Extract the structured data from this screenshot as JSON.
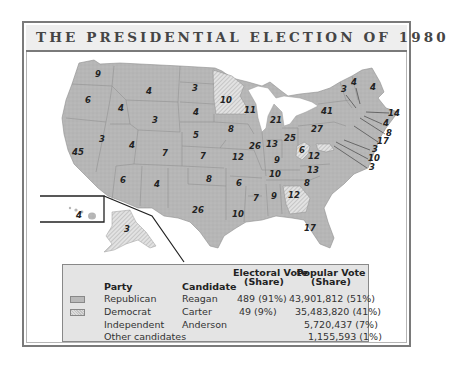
{
  "title": "THE PRESIDENTIAL ELECTION OF 1980",
  "colors": {
    "republican": "#b9b9b9",
    "democrat_hatched": "#d8d8d8",
    "frame": "#7a7a7a",
    "title_bg": "#eeeeee",
    "legend_bg": "#e4e4e4"
  },
  "legend": {
    "headers": {
      "party": "Party",
      "candidate": "Candidate",
      "electoral_1": "Electoral Vote",
      "electoral_2": "(Share)",
      "popular_1": "Popular Vote",
      "popular_2": "(Share)"
    },
    "rows": [
      {
        "party": "Republican",
        "candidate": "Reagan",
        "electoral": "489 (91%)",
        "popular": "43,901,812 (51%)",
        "swatch": "republican"
      },
      {
        "party": "Democrat",
        "candidate": "Carter",
        "electoral": "49 (9%)",
        "popular": "35,483,820 (41%)",
        "swatch": "democrat"
      },
      {
        "party": "Independent",
        "candidate": "Anderson",
        "electoral": "",
        "popular": "5,720,437 (7%)",
        "swatch": ""
      },
      {
        "party": "Other candidates",
        "candidate": "",
        "electoral": "",
        "popular": "1,155,593 (1%)",
        "swatch": ""
      }
    ]
  },
  "states": [
    {
      "state": "WA",
      "ev": "9",
      "party": "R",
      "x": 98,
      "y": 77
    },
    {
      "state": "OR",
      "ev": "6",
      "party": "R",
      "x": 88,
      "y": 103
    },
    {
      "state": "CA",
      "ev": "45",
      "party": "R",
      "x": 78,
      "y": 155
    },
    {
      "state": "ID",
      "ev": "4",
      "party": "R",
      "x": 121,
      "y": 111
    },
    {
      "state": "NV",
      "ev": "3",
      "party": "R",
      "x": 102,
      "y": 142
    },
    {
      "state": "MT",
      "ev": "4",
      "party": "R",
      "x": 149,
      "y": 94
    },
    {
      "state": "WY",
      "ev": "3",
      "party": "R",
      "x": 155,
      "y": 123
    },
    {
      "state": "UT",
      "ev": "4",
      "party": "R",
      "x": 132,
      "y": 148
    },
    {
      "state": "CO",
      "ev": "7",
      "party": "R",
      "x": 165,
      "y": 156
    },
    {
      "state": "AZ",
      "ev": "6",
      "party": "R",
      "x": 123,
      "y": 183
    },
    {
      "state": "NM",
      "ev": "4",
      "party": "R",
      "x": 157,
      "y": 187
    },
    {
      "state": "ND",
      "ev": "3",
      "party": "R",
      "x": 195,
      "y": 91
    },
    {
      "state": "SD",
      "ev": "4",
      "party": "R",
      "x": 196,
      "y": 115
    },
    {
      "state": "NE",
      "ev": "5",
      "party": "R",
      "x": 196,
      "y": 138
    },
    {
      "state": "KS",
      "ev": "7",
      "party": "R",
      "x": 203,
      "y": 159
    },
    {
      "state": "OK",
      "ev": "8",
      "party": "R",
      "x": 209,
      "y": 182
    },
    {
      "state": "TX",
      "ev": "26",
      "party": "R",
      "x": 198,
      "y": 213
    },
    {
      "state": "MN",
      "ev": "10",
      "party": "D",
      "x": 226,
      "y": 103
    },
    {
      "state": "IA",
      "ev": "8",
      "party": "R",
      "x": 231,
      "y": 132
    },
    {
      "state": "MO",
      "ev": "12",
      "party": "R",
      "x": 238,
      "y": 160
    },
    {
      "state": "AR",
      "ev": "6",
      "party": "R",
      "x": 239,
      "y": 186
    },
    {
      "state": "LA",
      "ev": "10",
      "party": "R",
      "x": 238,
      "y": 217
    },
    {
      "state": "WI",
      "ev": "11",
      "party": "R",
      "x": 250,
      "y": 113
    },
    {
      "state": "IL",
      "ev": "26",
      "party": "R",
      "x": 255,
      "y": 149
    },
    {
      "state": "MI",
      "ev": "21",
      "party": "R",
      "x": 276,
      "y": 123
    },
    {
      "state": "IN",
      "ev": "13",
      "party": "R",
      "x": 272,
      "y": 147
    },
    {
      "state": "OH",
      "ev": "25",
      "party": "R",
      "x": 290,
      "y": 141
    },
    {
      "state": "KY",
      "ev": "9",
      "party": "R",
      "x": 277,
      "y": 163
    },
    {
      "state": "TN",
      "ev": "10",
      "party": "R",
      "x": 275,
      "y": 177
    },
    {
      "state": "MS",
      "ev": "7",
      "party": "R",
      "x": 256,
      "y": 201
    },
    {
      "state": "AL",
      "ev": "9",
      "party": "R",
      "x": 274,
      "y": 199
    },
    {
      "state": "GA",
      "ev": "12",
      "party": "D",
      "x": 294,
      "y": 198
    },
    {
      "state": "FL",
      "ev": "17",
      "party": "R",
      "x": 310,
      "y": 231
    },
    {
      "state": "SC",
      "ev": "8",
      "party": "R",
      "x": 307,
      "y": 186
    },
    {
      "state": "NC",
      "ev": "13",
      "party": "R",
      "x": 313,
      "y": 173
    },
    {
      "state": "VA",
      "ev": "12",
      "party": "R",
      "x": 314,
      "y": 159
    },
    {
      "state": "WV",
      "ev": "6",
      "party": "D",
      "x": 302,
      "y": 153
    },
    {
      "state": "PA",
      "ev": "27",
      "party": "R",
      "x": 317,
      "y": 132
    },
    {
      "state": "NY",
      "ev": "41",
      "party": "R",
      "x": 327,
      "y": 114
    },
    {
      "state": "VT",
      "ev": "3",
      "party": "R",
      "x": 344,
      "y": 92
    },
    {
      "state": "NH",
      "ev": "4",
      "party": "R",
      "x": 354,
      "y": 85
    },
    {
      "state": "ME",
      "ev": "4",
      "party": "R",
      "x": 373,
      "y": 90
    },
    {
      "state": "MA",
      "ev": "14",
      "party": "R",
      "x": 394,
      "y": 116
    },
    {
      "state": "RI",
      "ev": "4",
      "party": "D",
      "x": 386,
      "y": 126
    },
    {
      "state": "CT",
      "ev": "8",
      "party": "R",
      "x": 389,
      "y": 136
    },
    {
      "state": "NJ",
      "ev": "17",
      "party": "R",
      "x": 383,
      "y": 144
    },
    {
      "state": "DE",
      "ev": "3",
      "party": "R",
      "x": 375,
      "y": 152
    },
    {
      "state": "MD",
      "ev": "10",
      "party": "D",
      "x": 374,
      "y": 161
    },
    {
      "state": "DC",
      "ev": "3",
      "party": "D",
      "x": 372,
      "y": 170
    },
    {
      "state": "HI",
      "ev": "4",
      "party": "D",
      "x": 79,
      "y": 218
    },
    {
      "state": "AK",
      "ev": "3",
      "party": "R",
      "x": 127,
      "y": 232
    }
  ]
}
